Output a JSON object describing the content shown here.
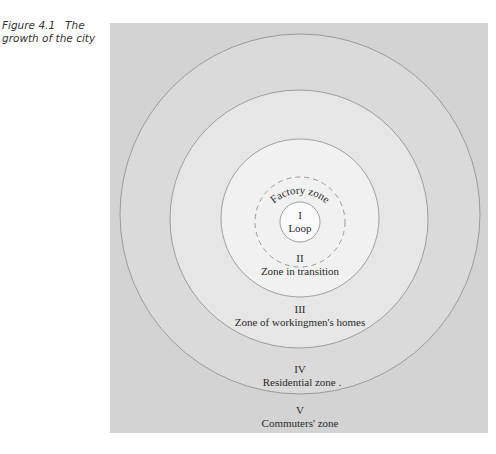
{
  "caption": {
    "number": "Figure 4.1",
    "title": "The growth of the city",
    "line1_title": "The",
    "line2": "growth of the city"
  },
  "diagram": {
    "type": "concentric-zones",
    "center": [
      300,
      218
    ],
    "colors": {
      "panel": "#d3d3d3",
      "zone_V": "#d3d3d3",
      "zone_IV": "#dadada",
      "zone_III": "#e6e6e6",
      "zone_II": "#f1f1f1",
      "zone_I": "#fafafa",
      "stroke": "#8a8a8a",
      "dashed": "#9a9a9a"
    },
    "zones": [
      {
        "numeral": "I",
        "name": "Loop"
      },
      {
        "numeral": "II",
        "name": "Zone in transition"
      },
      {
        "numeral": "III",
        "name": "Zone of workingmen's homes"
      },
      {
        "numeral": "IV",
        "name": "Residential zone ."
      },
      {
        "numeral": "V",
        "name": "Commuters' zone"
      }
    ],
    "subzone": {
      "name": "Factory zone"
    }
  }
}
